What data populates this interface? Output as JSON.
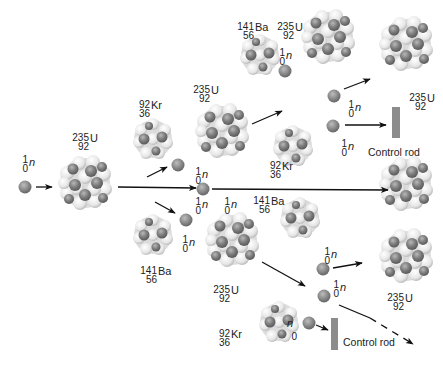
{
  "diagram": {
    "colors": {
      "proton": "#7d7d7d",
      "neutron_light": "#ececec",
      "neutron_mid": "#cfcfcf",
      "free_neutron": "#8a8a8a",
      "control_rod": "#8c8c8c",
      "arrow": "#111111"
    },
    "labels": {
      "neutron": {
        "mass": "1",
        "num": "0",
        "sym": "n"
      },
      "u235": {
        "mass": "235",
        "num": "92",
        "sym": "U"
      },
      "kr92": {
        "mass": "92",
        "num": "36",
        "sym": "Kr"
      },
      "ba141": {
        "mass": "141",
        "num": "56",
        "sym": "Ba"
      },
      "control_rod": "Control rod"
    },
    "nodes": [
      {
        "id": "n0",
        "type": "neutron",
        "x": 25,
        "y": 187
      },
      {
        "id": "u1",
        "type": "u235",
        "x": 85,
        "y": 183
      },
      {
        "id": "kr1",
        "type": "kr92",
        "x": 153,
        "y": 139
      },
      {
        "id": "ba1",
        "type": "ba141",
        "x": 153,
        "y": 236
      },
      {
        "id": "u2",
        "type": "u235",
        "x": 222,
        "y": 131
      },
      {
        "id": "u3",
        "type": "u235",
        "x": 232,
        "y": 240
      },
      {
        "id": "ba2",
        "type": "ba141",
        "x": 255,
        "y": 50
      },
      {
        "id": "kr2",
        "type": "kr92",
        "x": 293,
        "y": 147
      },
      {
        "id": "ba3",
        "type": "ba141",
        "x": 300,
        "y": 218
      },
      {
        "id": "kr3",
        "type": "kr92",
        "x": 275,
        "y": 320
      },
      {
        "id": "u4",
        "type": "u235",
        "x": 330,
        "y": 35
      },
      {
        "id": "u5",
        "type": "u235",
        "x": 410,
        "y": 42
      },
      {
        "id": "u6",
        "type": "u235",
        "x": 410,
        "y": 180
      },
      {
        "id": "u7",
        "type": "u235",
        "x": 405,
        "y": 248
      }
    ],
    "control_rods": [
      {
        "id": "rod1",
        "x": 392,
        "y": 107,
        "w": 9,
        "h": 32,
        "label_x": 368,
        "label_y": 146
      },
      {
        "id": "rod2",
        "x": 331,
        "y": 318,
        "w": 8,
        "h": 32,
        "label_x": 345,
        "label_y": 334
      }
    ]
  }
}
